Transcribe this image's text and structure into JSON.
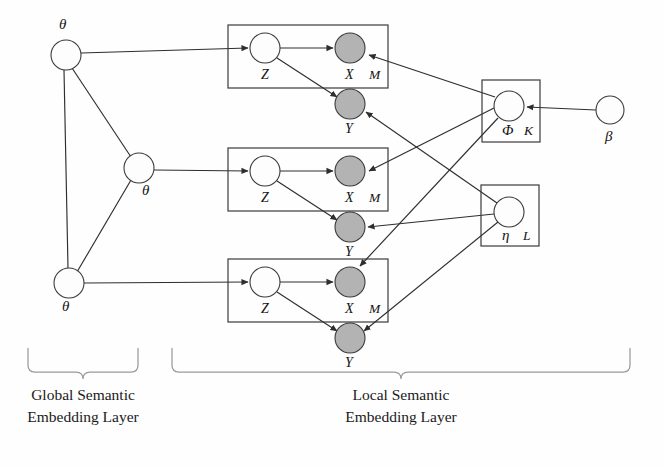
{
  "figure": {
    "type": "plate-notation-graphical-model",
    "background_color": "#fefefe",
    "observed_node_color": "#b3b3b3",
    "latent_node_color": "#fdfdfd",
    "stroke_color": "#2e2e2e"
  },
  "global_layer": {
    "caption_line1": "Global Semantic",
    "caption_line2": "Embedding Layer",
    "nodes": [
      {
        "id": "theta-top",
        "label": "θ",
        "shaded": false,
        "cx": 66,
        "cy": 55,
        "r": 15,
        "label_x": 62,
        "label_y": 30
      },
      {
        "id": "theta-middle",
        "label": "θ",
        "shaded": false,
        "cx": 139,
        "cy": 168,
        "r": 15,
        "label_x": 146,
        "label_y": 194
      },
      {
        "id": "theta-bottom",
        "label": "θ",
        "shaded": false,
        "cx": 69,
        "cy": 283,
        "r": 15,
        "label_x": 65,
        "label_y": 310
      }
    ]
  },
  "local_layer": {
    "caption_line1": "Local Semantic",
    "caption_line2": "Embedding Layer",
    "plates": [
      {
        "id": "plate-m-top",
        "count_label": "M",
        "x": 228,
        "y": 25,
        "width": 160,
        "height": 63,
        "count_x": 369,
        "count_y": 76,
        "z_node": {
          "label": "Z",
          "shaded": false,
          "cx": 265,
          "cy": 48,
          "r": 15,
          "label_x": 261,
          "label_y": 79
        },
        "x_node": {
          "label": "X",
          "shaded": true,
          "cx": 350,
          "cy": 48,
          "r": 15,
          "label_x": 345,
          "label_y": 79
        },
        "y_node": {
          "label": "Y",
          "shaded": true,
          "cx": 350,
          "cy": 104,
          "r": 15,
          "label_x": 345,
          "label_y": 133
        }
      },
      {
        "id": "plate-m-middle",
        "count_label": "M",
        "x": 228,
        "y": 148,
        "width": 160,
        "height": 63,
        "count_x": 369,
        "count_y": 199,
        "z_node": {
          "label": "Z",
          "shaded": false,
          "cx": 265,
          "cy": 171,
          "r": 15,
          "label_x": 261,
          "label_y": 202
        },
        "x_node": {
          "label": "X",
          "shaded": true,
          "cx": 350,
          "cy": 171,
          "r": 15,
          "label_x": 345,
          "label_y": 202
        },
        "y_node": {
          "label": "Y",
          "shaded": true,
          "cx": 350,
          "cy": 227,
          "r": 15,
          "label_x": 345,
          "label_y": 256
        }
      },
      {
        "id": "plate-m-bottom",
        "count_label": "M",
        "x": 228,
        "y": 259,
        "width": 160,
        "height": 63,
        "count_x": 369,
        "count_y": 310,
        "z_node": {
          "label": "Z",
          "shaded": false,
          "cx": 265,
          "cy": 282,
          "r": 15,
          "label_x": 261,
          "label_y": 313
        },
        "x_node": {
          "label": "X",
          "shaded": true,
          "cx": 350,
          "cy": 282,
          "r": 15,
          "label_x": 345,
          "label_y": 313
        },
        "y_node": {
          "label": "Y",
          "shaded": true,
          "cx": 350,
          "cy": 338,
          "r": 15,
          "label_x": 345,
          "label_y": 367
        }
      }
    ],
    "topic_plate": {
      "id": "plate-k",
      "count_label": "K",
      "x": 482,
      "y": 80,
      "width": 58,
      "height": 62,
      "count_x": 524,
      "count_y": 132,
      "node": {
        "label": "Φ",
        "shaded": false,
        "cx": 509,
        "cy": 106,
        "r": 15,
        "label_x": 504,
        "label_y": 134
      }
    },
    "sentiment_plate": {
      "id": "plate-l",
      "count_label": "L",
      "x": 481,
      "y": 185,
      "width": 58,
      "height": 61,
      "count_x": 524,
      "count_y": 236,
      "node": {
        "label": "η",
        "shaded": false,
        "cx": 509,
        "cy": 212,
        "r": 15,
        "label_x": 503,
        "label_y": 239
      }
    },
    "prior_node": {
      "id": "beta",
      "label": "β",
      "shaded": false,
      "cx": 610,
      "cy": 110,
      "r": 14,
      "label_x": 606,
      "label_y": 140
    }
  },
  "braces": [
    {
      "id": "brace-global",
      "x1": 28,
      "x2": 138,
      "y": 348,
      "caption_cx": 83
    },
    {
      "id": "brace-local",
      "x1": 172,
      "x2": 630,
      "y": 348,
      "caption_cx": 401
    }
  ],
  "captions": [
    {
      "id": "caption-global",
      "cx": 83,
      "y1": 398,
      "y2": 420
    },
    {
      "id": "caption-local",
      "cx": 401,
      "y1": 398,
      "y2": 420
    }
  ],
  "edges": {
    "description": "theta->Z per plate, Z->X, Z->Y, Phi->X, eta->Y, beta->Phi, theta triangle",
    "count": 17
  }
}
